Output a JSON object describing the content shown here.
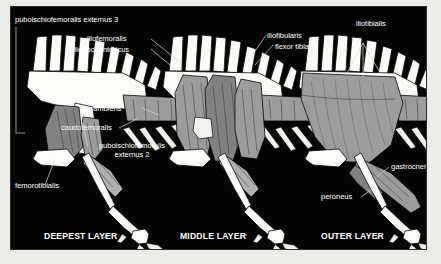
{
  "figure": {
    "background": "#edece9",
    "panel_background": "#050505",
    "muscle_color": "#9c9c9c",
    "bone_color": "#fbfbf8",
    "label_color": "#ffffff"
  },
  "panels": [
    {
      "caption": "DEEPEST LAYER",
      "labels": [
        {
          "text": "puboischiofemoralis externus 3"
        },
        {
          "text": "iliofemoralis"
        },
        {
          "text": "iliotrochantericus"
        },
        {
          "text": "caudofemoralis"
        },
        {
          "text": "puboischiofemoralis externus 2"
        },
        {
          "text": "femorotibialis"
        }
      ]
    },
    {
      "caption": "MIDDLE LAYER",
      "labels": [
        {
          "text": "iliofibularis"
        },
        {
          "text": "flexor tibialis"
        },
        {
          "text": "ambiens"
        }
      ]
    },
    {
      "caption": "OUTER LAYER",
      "labels": [
        {
          "text": "iliotibialis"
        },
        {
          "text": "gastrocnemius"
        },
        {
          "text": "peroneus"
        }
      ]
    }
  ],
  "labels": {
    "pife3": "puboischiofemoralis externus 3",
    "iliofemoralis": "iliofemoralis",
    "iliotrochantericus": "iliotrochantericus",
    "iliofibularis": "iliofibularis",
    "flexor_tibialis": "flexor tibialis",
    "iliotibialis": "iliotibialis",
    "ambiens": "ambiens",
    "caudofemoralis": "caudofemoralis",
    "pife2": "puboischiofemoralis externus 2",
    "femorotibialis": "femorotibialis",
    "gastrocnemius": "gastrocnemius",
    "peroneus": "peroneus"
  },
  "captions": {
    "deepest": "DEEPEST LAYER",
    "middle": "MIDDLE LAYER",
    "outer": "OUTER LAYER"
  }
}
